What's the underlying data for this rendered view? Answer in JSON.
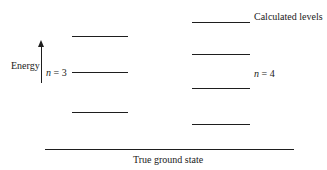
{
  "diagram": {
    "axis": {
      "label": "Energy",
      "direction": "up"
    },
    "left_column": {
      "label_n": "n",
      "label_eq": "= 3",
      "levels": [
        {
          "y": 37,
          "x1": 72,
          "x2": 128
        },
        {
          "y": 73,
          "x1": 72,
          "x2": 128
        },
        {
          "y": 113,
          "x1": 72,
          "x2": 128
        }
      ]
    },
    "right_column": {
      "label_n": "n",
      "label_eq": "= 4",
      "levels": [
        {
          "y": 23,
          "x1": 192,
          "x2": 250
        },
        {
          "y": 55,
          "x1": 192,
          "x2": 250
        },
        {
          "y": 89,
          "x1": 192,
          "x2": 250
        },
        {
          "y": 125,
          "x1": 192,
          "x2": 250
        }
      ]
    },
    "calculated_levels_label": "Calculated levels",
    "ground_state": {
      "label": "True ground state",
      "y": 150,
      "x1": 45,
      "x2": 294
    },
    "colors": {
      "line": "#1e1e1e",
      "background": "#ffffff"
    }
  }
}
